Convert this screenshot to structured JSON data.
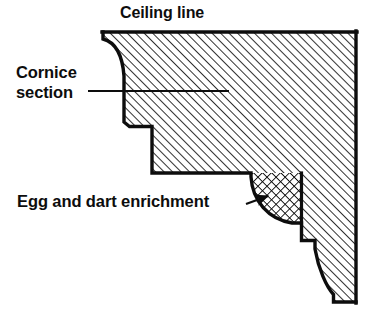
{
  "figure": {
    "kind": "architectural-section-drawing",
    "background_color": "#ffffff",
    "ink_color": "#0d0d0d",
    "width": 382,
    "height": 329
  },
  "labels": {
    "ceiling_line": "Ceiling line",
    "cornice_section_line1": "Cornice",
    "cornice_section_line2": "section",
    "egg_and_dart": "Egg and dart enrichment"
  },
  "leaders": {
    "cornice_section": {
      "type": "plain-line",
      "from_x": 88,
      "from_y": 91,
      "to_x": 229,
      "to_y": 91
    },
    "egg_and_dart": {
      "type": "arrow",
      "from_x": 246,
      "from_y": 204,
      "to_x": 270,
      "to_y": 195,
      "arrowhead": "filled-triangle"
    }
  },
  "geometry": {
    "ceiling_line": {
      "x1": 103,
      "y1": 32,
      "x2": 356,
      "y2": 32
    },
    "wall_line": {
      "x1": 356,
      "y1": 32,
      "x2": 356,
      "y2": 302
    },
    "profile_outline": "M 103 32 L 103 39 C 116 42 122 56 124 76 L 124 122 L 129 126 L 152 126 L 152 173 L 251 173 L 251 176 C 252 200 268 219 292 223 L 301 223 L 301 240 L 315 240 L 315 249 C 318 268 326 286 333 294 L 333 302 L 356 302",
    "cove_curve": {
      "description": "quarter-hollow cove from ceiling line down to fascia",
      "start": [
        103,
        39
      ],
      "end": [
        124,
        76
      ]
    },
    "ovolo_enrichment": {
      "description": "quarter-round egg and dart member",
      "bbox": [
        251,
        173,
        301,
        224
      ]
    },
    "cyma_recta": {
      "description": "lower S-curve bed mould",
      "start": [
        315,
        249
      ],
      "end": [
        333,
        294
      ]
    }
  },
  "hatching": {
    "section_fill": {
      "style": "single-diagonal",
      "angle_deg": 45,
      "spacing_px": 6,
      "color": "#0d0d0d"
    },
    "enrichment_fill": {
      "style": "cross-hatch",
      "angle_deg": 45,
      "spacing_px": 6,
      "color": "#0d0d0d"
    }
  }
}
